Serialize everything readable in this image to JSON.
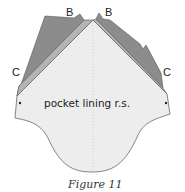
{
  "diagram": {
    "labels": {
      "b_left": "B",
      "b_right": "B",
      "c_left": "C",
      "c_right": "C",
      "center_text": "pocket lining r.s."
    },
    "caption": "Figure 11",
    "colors": {
      "fabric_dark": "#8c8c8c",
      "fabric_mid": "#b4b4b4",
      "lining": "#ededed",
      "outline": "#555555"
    }
  }
}
